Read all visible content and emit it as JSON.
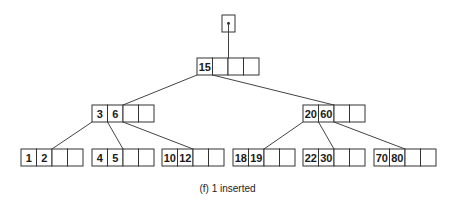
{
  "caption": "(f) 1 inserted",
  "colors": {
    "stroke": "#333333",
    "text": "#1a1a1a",
    "background": "#ffffff"
  },
  "cell": {
    "width": 15.5,
    "height": 17,
    "slots": 4
  },
  "root_pointer": {
    "x": 222,
    "y": 15,
    "w": 13,
    "h": 17,
    "icon": "pointer-dot-icon",
    "target": "root"
  },
  "nodes": [
    {
      "id": "root",
      "level": 0,
      "x": 197,
      "y": 58,
      "keys": [
        "15"
      ]
    },
    {
      "id": "n36",
      "level": 1,
      "x": 92,
      "y": 105,
      "keys": [
        "3",
        "6"
      ]
    },
    {
      "id": "n2060",
      "level": 1,
      "x": 303,
      "y": 105,
      "keys": [
        "20",
        "60"
      ]
    },
    {
      "id": "l12",
      "level": 2,
      "x": 21,
      "y": 149,
      "keys": [
        "1",
        "2"
      ]
    },
    {
      "id": "l45",
      "level": 2,
      "x": 92,
      "y": 149,
      "keys": [
        "4",
        "5"
      ]
    },
    {
      "id": "l1012",
      "level": 2,
      "x": 162,
      "y": 149,
      "keys": [
        "10",
        "12"
      ]
    },
    {
      "id": "l1819",
      "level": 2,
      "x": 233,
      "y": 149,
      "keys": [
        "18",
        "19"
      ]
    },
    {
      "id": "l2230",
      "level": 2,
      "x": 303,
      "y": 149,
      "keys": [
        "22",
        "30"
      ]
    },
    {
      "id": "l7080",
      "level": 2,
      "x": 374,
      "y": 149,
      "keys": [
        "70",
        "80"
      ]
    }
  ],
  "edges": [
    {
      "from": "root",
      "slot": 0,
      "to": "n36"
    },
    {
      "from": "root",
      "slot": 1,
      "to": "n2060"
    },
    {
      "from": "n36",
      "slot": 0,
      "to": "l12"
    },
    {
      "from": "n36",
      "slot": 1,
      "to": "l45"
    },
    {
      "from": "n36",
      "slot": 2,
      "to": "l1012"
    },
    {
      "from": "n2060",
      "slot": 0,
      "to": "l1819"
    },
    {
      "from": "n2060",
      "slot": 1,
      "to": "l2230"
    },
    {
      "from": "n2060",
      "slot": 2,
      "to": "l7080"
    }
  ]
}
